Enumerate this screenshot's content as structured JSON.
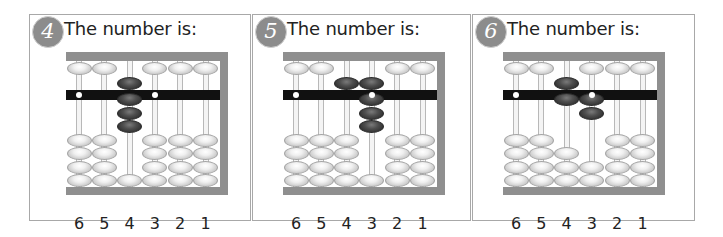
{
  "question_prompt": "The number is:",
  "column_labels": [
    "6",
    "5",
    "4",
    "3",
    "2",
    "1"
  ],
  "colors": {
    "frame": "#8f8f8f",
    "beam": "#111111",
    "active_bead": "#3a3a3a",
    "inactive_bead": "#eeeeee",
    "badge": "#8c8c8c",
    "panel_border": "#a8a8a8"
  },
  "panels": [
    {
      "number": "4",
      "title": "The number is:",
      "columns": [
        {
          "label": "6",
          "upper_active": false,
          "lower_active": 0
        },
        {
          "label": "5",
          "upper_active": false,
          "lower_active": 0
        },
        {
          "label": "4",
          "upper_active": true,
          "lower_active": 3
        },
        {
          "label": "3",
          "upper_active": false,
          "lower_active": 0
        },
        {
          "label": "2",
          "upper_active": false,
          "lower_active": 0
        },
        {
          "label": "1",
          "upper_active": false,
          "lower_active": 0
        }
      ]
    },
    {
      "number": "5",
      "title": "The number is:",
      "columns": [
        {
          "label": "6",
          "upper_active": false,
          "lower_active": 0
        },
        {
          "label": "5",
          "upper_active": false,
          "lower_active": 0
        },
        {
          "label": "4",
          "upper_active": true,
          "lower_active": 0
        },
        {
          "label": "3",
          "upper_active": true,
          "lower_active": 3
        },
        {
          "label": "2",
          "upper_active": false,
          "lower_active": 0
        },
        {
          "label": "1",
          "upper_active": false,
          "lower_active": 0
        }
      ]
    },
    {
      "number": "6",
      "title": "The number is:",
      "columns": [
        {
          "label": "6",
          "upper_active": false,
          "lower_active": 0
        },
        {
          "label": "5",
          "upper_active": false,
          "lower_active": 0
        },
        {
          "label": "4",
          "upper_active": true,
          "lower_active": 1
        },
        {
          "label": "3",
          "upper_active": false,
          "lower_active": 2
        },
        {
          "label": "2",
          "upper_active": false,
          "lower_active": 0
        },
        {
          "label": "1",
          "upper_active": false,
          "lower_active": 0
        }
      ]
    }
  ]
}
